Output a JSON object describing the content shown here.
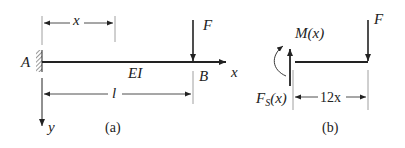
{
  "figure_a": {
    "caption": "(a)",
    "support_label": "A",
    "end_label": "B",
    "stiffness_label": "EI",
    "load_label": "F",
    "x_dimension_label": "x",
    "length_label": "l",
    "x_axis_label": "x",
    "y_axis_label": "y"
  },
  "figure_b": {
    "caption": "(b)",
    "moment_label": "M(x)",
    "shear_label_main": "F",
    "shear_label_sub": "S",
    "shear_label_arg": "(x)",
    "load_label": "F",
    "segment_dimension_label": "12x"
  },
  "colors": {
    "ink": "#222222",
    "guide": "#888888"
  }
}
